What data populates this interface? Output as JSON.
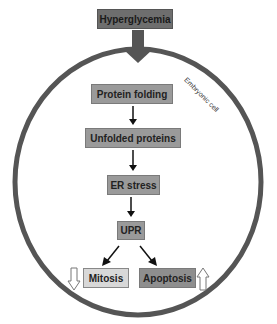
{
  "diagram": {
    "top_node": "Hyperglycemia",
    "cell_label": "Embryonic cell",
    "nodes": [
      {
        "id": "protein_folding",
        "label": "Protein folding"
      },
      {
        "id": "unfolded_proteins",
        "label": "Unfolded proteins"
      },
      {
        "id": "er_stress",
        "label": "ER stress"
      },
      {
        "id": "upr",
        "label": "UPR"
      },
      {
        "id": "mitosis",
        "label": "Mitosis",
        "change": "decrease"
      },
      {
        "id": "apoptosis",
        "label": "Apoptosis",
        "change": "increase"
      }
    ],
    "edges": [
      {
        "from": "Hyperglycemia",
        "to": "Protein folding",
        "style": "thick"
      },
      {
        "from": "Protein folding",
        "to": "Unfolded proteins"
      },
      {
        "from": "Unfolded proteins",
        "to": "ER stress"
      },
      {
        "from": "ER stress",
        "to": "UPR"
      },
      {
        "from": "UPR",
        "to": "Mitosis"
      },
      {
        "from": "UPR",
        "to": "Apoptosis"
      }
    ],
    "indicators": {
      "mitosis": "down-arrow-outline",
      "apoptosis": "up-arrow-outline"
    },
    "colors": {
      "circle": "#555555",
      "top_box": "#6e6e6e",
      "mid_box": "#9a9a9a",
      "mitosis_box": "#d8d8d8",
      "apoptosis_box": "#8e8e8e"
    }
  }
}
